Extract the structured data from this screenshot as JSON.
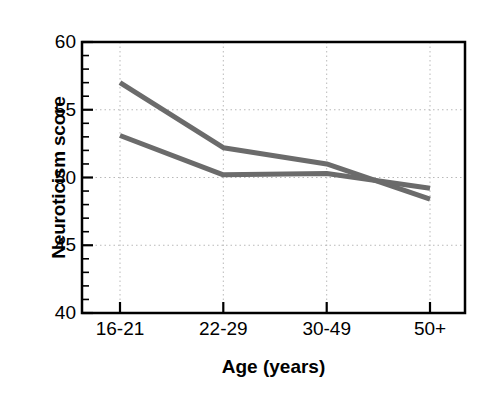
{
  "chart_data": {
    "type": "line",
    "title": "",
    "xlabel": "Age (years)",
    "ylabel": "Neuroticism score",
    "categories": [
      "16-21",
      "22-29",
      "30-49",
      "50+"
    ],
    "ylim": [
      40,
      60
    ],
    "ytick_labels": [
      "40",
      "45",
      "50",
      "55",
      "60"
    ],
    "ytick_values": [
      40,
      45,
      50,
      55,
      60
    ],
    "yminor_step": 1,
    "grid": "dotted-both-axes",
    "legend": "none",
    "series": [
      {
        "name": "series-1",
        "color": "#6b6b6b",
        "values": [
          57.0,
          52.2,
          51.0,
          48.4
        ]
      },
      {
        "name": "series-2",
        "color": "#6b6b6b",
        "values": [
          53.1,
          50.2,
          50.3,
          49.2
        ]
      }
    ]
  },
  "style": {
    "line_color": "#6b6b6b",
    "axis_color": "#000000",
    "grid_color": "#b9b9b9",
    "background": "#ffffff",
    "line_width": 5
  }
}
